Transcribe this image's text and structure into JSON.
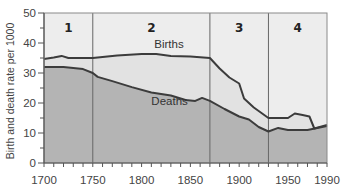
{
  "chart_data": {
    "type": "area",
    "title": "",
    "xlabel": "",
    "ylabel": "Birth and death rate per 1000",
    "xlim": [
      1700,
      1990
    ],
    "ylim": [
      0,
      50
    ],
    "x_ticks": [
      1700,
      1750,
      1800,
      1850,
      1900,
      1950,
      1990
    ],
    "y_ticks": [
      0,
      10,
      20,
      30,
      40,
      50
    ],
    "grid": false,
    "legend": "inline labels",
    "periods": [
      {
        "label": "1",
        "start": 1700,
        "end": 1750
      },
      {
        "label": "2",
        "start": 1750,
        "end": 1870
      },
      {
        "label": "3",
        "start": 1870,
        "end": 1930
      },
      {
        "label": "4",
        "start": 1930,
        "end": 1990
      }
    ],
    "series": [
      {
        "name": "Births",
        "x": [
          1700,
          1710,
          1718,
          1725,
          1750,
          1775,
          1800,
          1815,
          1830,
          1850,
          1870,
          1880,
          1890,
          1900,
          1905,
          1915,
          1930,
          1950,
          1957,
          1965,
          1972,
          1977,
          1990
        ],
        "values": [
          34.7,
          35.2,
          35.7,
          35.0,
          35.0,
          35.8,
          36.3,
          36.3,
          35.7,
          35.5,
          35.0,
          31.5,
          28.5,
          26.5,
          21.5,
          18.5,
          15.0,
          15.0,
          16.5,
          16.0,
          15.5,
          11.5,
          12.7
        ]
      },
      {
        "name": "Deaths",
        "x": [
          1700,
          1720,
          1740,
          1750,
          1755,
          1770,
          1790,
          1810,
          1830,
          1845,
          1855,
          1862,
          1870,
          1885,
          1900,
          1910,
          1920,
          1930,
          1940,
          1950,
          1970,
          1990
        ],
        "values": [
          32.0,
          32.0,
          31.3,
          30.0,
          28.7,
          27.3,
          25.3,
          23.5,
          22.5,
          21.0,
          20.7,
          21.7,
          20.7,
          18.0,
          15.5,
          14.5,
          12.0,
          10.5,
          11.7,
          11.0,
          11.0,
          12.3
        ]
      }
    ],
    "annotations": [
      {
        "text": "Births",
        "x": 1813,
        "y": 38.5
      },
      {
        "text": "Deaths",
        "x": 1810,
        "y": 19.5
      }
    ],
    "colors": {
      "plot_background": "#ededed",
      "gap_fill": "#e2e2e2",
      "deaths_fill": "#b4b4b4",
      "line": "#3c3c3c",
      "axis": "#555555",
      "divider": "#666666"
    }
  }
}
